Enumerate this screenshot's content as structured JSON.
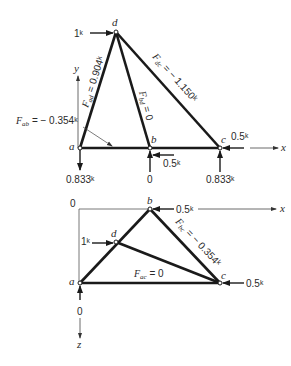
{
  "top_view": {
    "nodes": {
      "a": "a",
      "b": "b",
      "c": "c",
      "d": "d"
    },
    "axes": {
      "x": "x",
      "y": "y"
    },
    "applied_load_d": "1ᵏ",
    "load_b": "0.5ᵏ",
    "load_c": "0.5ᵏ",
    "reaction_a": "0.833ᵏ",
    "reaction_b": "0",
    "reaction_c": "0.833ᵏ",
    "member_forces": {
      "ad": "F_ad = 0.904ᵏ",
      "ad_name": "F",
      "ad_sub": "ad",
      "ad_val": " = 0.904ᵏ",
      "bd_name": "F",
      "bd_sub": "bd",
      "bd_val": " = 0",
      "dc_name": "F",
      "dc_sub": "dc",
      "dc_val": " = − 1.150ᵏ",
      "ab_name": "F",
      "ab_sub": "ab",
      "ab_val": " = − 0.354ᵏ"
    }
  },
  "bottom_view": {
    "nodes": {
      "a": "a",
      "b": "b",
      "c": "c",
      "d": "d"
    },
    "axes": {
      "x": "x",
      "z": "z",
      "origin": "0"
    },
    "applied_load_d": "1ᵏ",
    "load_b": "0.5ᵏ",
    "load_c": "0.5ᵏ",
    "reaction_a": "0",
    "member_forces": {
      "bc_name": "F",
      "bc_sub": "bc",
      "bc_val": " = − 0.354ᵏ",
      "ac_name": "F",
      "ac_sub": "ac",
      "ac_val": " = 0"
    }
  },
  "colors": {
    "member": "#1a1a1a",
    "text": "#2a2a2a",
    "thin": "#444444"
  }
}
